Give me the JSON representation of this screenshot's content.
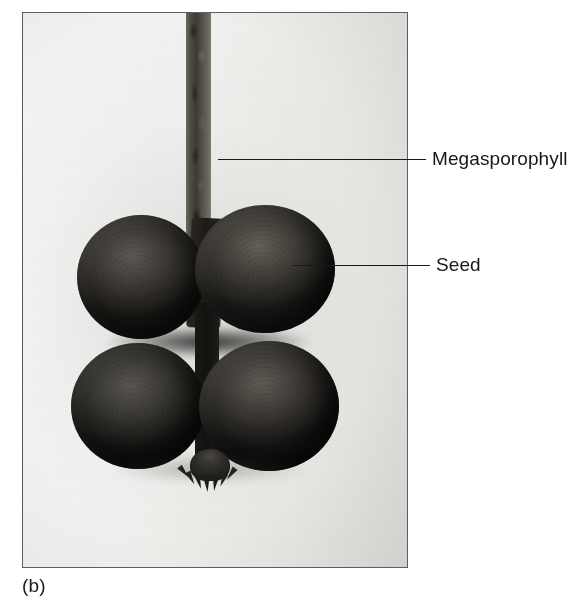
{
  "figure": {
    "caption": "(b)",
    "photo": {
      "subject": "cycad megasporophyll with four attached seeds",
      "border_color": "#5b5f63",
      "background_color": "#eeeeec"
    },
    "callouts": [
      {
        "id": "megasporophyll",
        "label": "Megasporophyll",
        "line_color": "#16171a",
        "target": "stalk"
      },
      {
        "id": "seed",
        "label": "Seed",
        "line_color": "#16171a",
        "target": "upper-right-seed"
      }
    ],
    "specimen_parts": {
      "stalk_name": "megasporophyll-stalk",
      "seed_count": 4,
      "seed_positions": [
        "upper-left",
        "upper-right",
        "lower-left",
        "lower-right"
      ],
      "apex_name": "spiny-apex"
    }
  }
}
